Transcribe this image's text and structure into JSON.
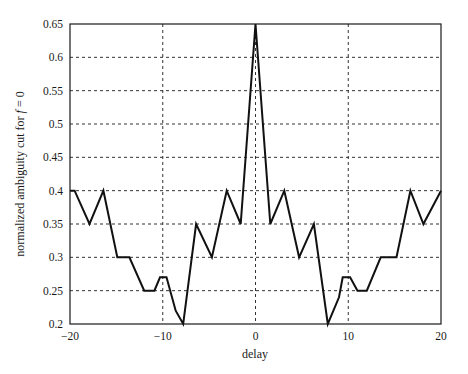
{
  "chart_data": {
    "type": "line",
    "title": "",
    "xlabel": "delay",
    "ylabel": "normalized ambiguity cut for f = 0",
    "ylabel_parts": {
      "prefix": "normalized ambiguity cut for ",
      "var": "f",
      "suffix": " = 0"
    },
    "xlim": [
      -20,
      20
    ],
    "ylim": [
      0.2,
      0.65
    ],
    "xticks": [
      -20,
      -10,
      0,
      10,
      20
    ],
    "xtick_labels": [
      "−20",
      "−10",
      "0",
      "10",
      "20"
    ],
    "yticks": [
      0.2,
      0.25,
      0.3,
      0.35,
      0.4,
      0.45,
      0.5,
      0.55,
      0.6,
      0.65
    ],
    "ytick_labels": [
      "0.2",
      "0.25",
      "0.3",
      "0.35",
      "0.4",
      "0.45",
      "0.5",
      "0.55",
      "0.6",
      "0.65"
    ],
    "grid": true,
    "grid_style": "dashed",
    "legend": null,
    "series": [
      {
        "name": "ambiguity cut",
        "color": "#111111",
        "x": [
          -20,
          -19.5,
          -17.9,
          -16.4,
          -14.9,
          -13.6,
          -12.0,
          -10.9,
          -10.3,
          -9.6,
          -8.6,
          -7.8,
          -6.4,
          -4.7,
          -3.1,
          -1.6,
          0,
          1.6,
          3.1,
          4.7,
          6.3,
          7.8,
          9.0,
          9.4,
          10.2,
          11.0,
          12.0,
          13.5,
          15.2,
          16.7,
          18.1,
          20
        ],
        "y": [
          0.4,
          0.4,
          0.35,
          0.4,
          0.3,
          0.3,
          0.25,
          0.25,
          0.27,
          0.27,
          0.22,
          0.2,
          0.35,
          0.3,
          0.4,
          0.35,
          0.65,
          0.35,
          0.4,
          0.3,
          0.35,
          0.2,
          0.24,
          0.27,
          0.27,
          0.25,
          0.25,
          0.3,
          0.3,
          0.4,
          0.35,
          0.4
        ]
      }
    ]
  },
  "colors": {
    "line": "#111111",
    "axis": "#1a1a1a",
    "grid": "#333333",
    "background": "#ffffff"
  }
}
